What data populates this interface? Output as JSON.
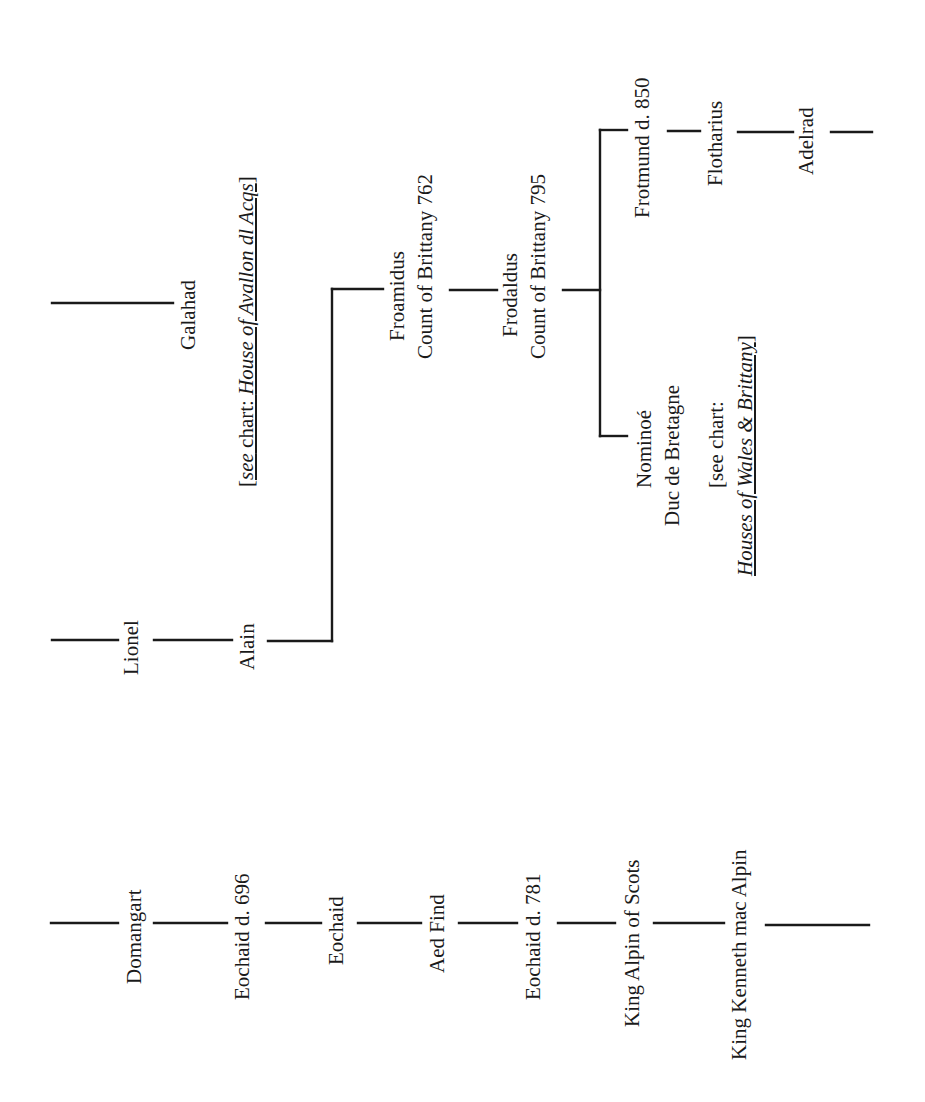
{
  "chart": {
    "orientation": "rotated-90-ccw",
    "line_color": "#1a1a1a",
    "background": "#ffffff"
  },
  "scots_line": {
    "persons": [
      {
        "name": "Domangart"
      },
      {
        "name": "Eochaid d. 696"
      },
      {
        "name": "Eochaid"
      },
      {
        "name": "Aed Find"
      },
      {
        "name": "Eochaid d. 781"
      },
      {
        "name": "King Alpin of Scots"
      },
      {
        "name": "King Kenneth mac Alpin"
      }
    ]
  },
  "avalon_line": {
    "lionel": "Lionel",
    "alain": "Alain",
    "galahad": "Galahad",
    "galahad_ref": {
      "open": "[",
      "see": "see",
      "chart_text": " chart: ",
      "title": "House of Avallon dl Acqs",
      "close": "]"
    }
  },
  "brittany_line": {
    "froamidus": {
      "name": "Froamidus",
      "title": "Count of Brittany 762"
    },
    "frodaldus": {
      "name": "Frodaldus",
      "title": "Count of Brittany 795"
    },
    "nominoe": {
      "name": "Nominoé",
      "title": "Duc de Bretagne",
      "ref_line1": "[see chart:",
      "ref_title": "Houses of Wales & Brittany",
      "ref_close": "]"
    },
    "frotmund": {
      "name": "Frotmund d. 850"
    },
    "flotharius": {
      "name": "Flotharius"
    },
    "adelrad": {
      "name": "Adelrad"
    }
  }
}
